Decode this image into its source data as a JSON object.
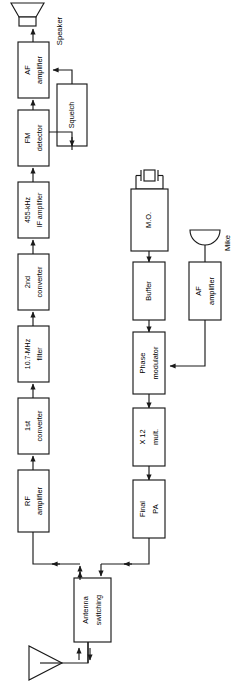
{
  "diagram": {
    "orientation": "rotated-90-ccw",
    "line_color": "#1a1a1a",
    "background": "#ffffff",
    "receive_chain": [
      {
        "id": "af-amplifier-rx",
        "lines": [
          "AF",
          "amplifier"
        ]
      },
      {
        "id": "fm-detector",
        "lines": [
          "FM",
          "detector"
        ]
      },
      {
        "id": "if-amplifier",
        "lines": [
          "455-kHz",
          "IF amplifier"
        ]
      },
      {
        "id": "second-converter",
        "lines": [
          "2nd",
          "converter"
        ]
      },
      {
        "id": "filter",
        "lines": [
          "10.7-MHz",
          "filter"
        ]
      },
      {
        "id": "first-converter",
        "lines": [
          "1st",
          "converter"
        ]
      },
      {
        "id": "rf-amplifier",
        "lines": [
          "RF",
          "amplifier"
        ]
      }
    ],
    "transmit_chain": [
      {
        "id": "master-oscillator",
        "lines": [
          "M.O."
        ]
      },
      {
        "id": "buffer",
        "lines": [
          "Buffer"
        ]
      },
      {
        "id": "phase-modulator",
        "lines": [
          "Phase",
          "modulator"
        ]
      },
      {
        "id": "multiplier",
        "lines": [
          "X 12",
          "mult."
        ]
      },
      {
        "id": "final-pa",
        "lines": [
          "Final",
          "PA"
        ]
      }
    ],
    "audio_input_chain": [
      {
        "id": "af-amplifier-tx",
        "lines": [
          "AF",
          "amplifier"
        ]
      }
    ],
    "aux_blocks": [
      {
        "id": "squelch",
        "lines": [
          "Squelch"
        ]
      },
      {
        "id": "antenna-switching",
        "lines": [
          "Antenna",
          "switching"
        ]
      }
    ],
    "symbols": [
      {
        "id": "speaker",
        "label": "Speaker"
      },
      {
        "id": "mike",
        "label": "Mike"
      },
      {
        "id": "crystal",
        "label": ""
      },
      {
        "id": "antenna",
        "label": ""
      }
    ]
  }
}
